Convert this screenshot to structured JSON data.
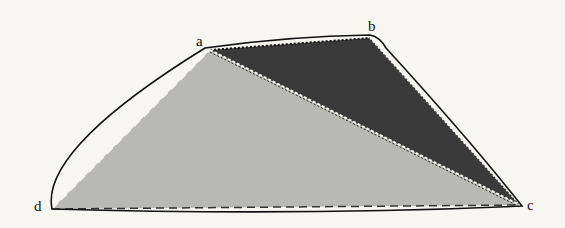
{
  "diagram": {
    "colors": {
      "background": "#f8f6f0",
      "light_region": "#b8b8b4",
      "dark_region": "#3a3a3a",
      "stroke": "#111111"
    },
    "vertices": {
      "a": {
        "label": "a",
        "x": 210,
        "y": 50
      },
      "b": {
        "label": "b",
        "x": 370,
        "y": 38
      },
      "c": {
        "label": "c",
        "x": 520,
        "y": 205
      },
      "d": {
        "label": "d",
        "x": 52,
        "y": 209
      }
    },
    "regions": [
      {
        "name": "triangle-abc",
        "fill": "dark",
        "vertices": [
          "a",
          "b",
          "c"
        ]
      },
      {
        "name": "triangle-acd",
        "fill": "light",
        "vertices": [
          "a",
          "c",
          "d"
        ]
      }
    ],
    "edges": [
      {
        "name": "hull-curve",
        "style": "solid",
        "description": "outer curved boundary d-a-b-c-d"
      },
      {
        "name": "edge-da",
        "style": "dashed"
      },
      {
        "name": "edge-dc",
        "style": "dashed"
      },
      {
        "name": "edge-ab",
        "style": "dotted"
      },
      {
        "name": "edge-bc",
        "style": "dotted"
      },
      {
        "name": "edge-ac",
        "style": "dotted"
      }
    ]
  }
}
